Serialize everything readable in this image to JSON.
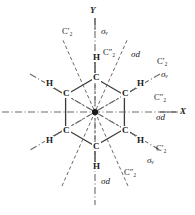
{
  "figure": {
    "type": "symmetry-element-diagram",
    "molecule": "benzene"
  },
  "axes": {
    "x_label": "X",
    "y_label": "Y"
  },
  "atoms": {
    "carbon_label": "C",
    "hydrogen_label": "H",
    "carbons": [
      {
        "id": "c-top",
        "label": "C"
      },
      {
        "id": "c-upper-left",
        "label": "C"
      },
      {
        "id": "c-upper-right",
        "label": "C"
      },
      {
        "id": "c-lower-left",
        "label": "C"
      },
      {
        "id": "c-lower-right",
        "label": "C"
      },
      {
        "id": "c-bottom",
        "label": "C"
      }
    ],
    "hydrogens": [
      {
        "id": "h-top",
        "label": "H"
      },
      {
        "id": "h-upper-left",
        "label": "H"
      },
      {
        "id": "h-upper-right",
        "label": "H"
      },
      {
        "id": "h-lower-left",
        "label": "H"
      },
      {
        "id": "h-lower-right",
        "label": "H"
      },
      {
        "id": "h-bottom",
        "label": "H"
      }
    ]
  },
  "symmetry_labels": {
    "c2_prime": {
      "base": "C",
      "sub": "2",
      "prime": "′"
    },
    "c2_double_prime": {
      "base": "C",
      "sub": "2",
      "prime": "″"
    },
    "sigma_v": {
      "base": "σ",
      "sub": "v"
    },
    "sigma_d": {
      "base": "σ",
      "sub": "d"
    },
    "items": [
      {
        "id": "c2p-top",
        "text": "C′₂",
        "kind": "C2-prime"
      },
      {
        "id": "sv-top",
        "text": "σᵥ",
        "kind": "sigma-v"
      },
      {
        "id": "c2pp-upper",
        "text": "C″₂",
        "kind": "C2-double-prime"
      },
      {
        "id": "sd-upper",
        "text": "σd",
        "kind": "sigma-d"
      },
      {
        "id": "c2p-right",
        "text": "C′₂",
        "kind": "C2-prime"
      },
      {
        "id": "sv-right",
        "text": "σᵥ",
        "kind": "sigma-v"
      },
      {
        "id": "c2pp-xaxis",
        "text": "C″₂",
        "kind": "C2-double-prime"
      },
      {
        "id": "sd-xaxis",
        "text": "σd",
        "kind": "sigma-d"
      },
      {
        "id": "c2p-lower",
        "text": "C′₂",
        "kind": "C2-prime"
      },
      {
        "id": "sv-lower",
        "text": "σᵥ",
        "kind": "sigma-v"
      },
      {
        "id": "c2pp-bottom",
        "text": "C″₂",
        "kind": "C2-double-prime"
      },
      {
        "id": "sd-bottom",
        "text": "σd",
        "kind": "sigma-d"
      }
    ]
  },
  "colors": {
    "ink": "#1a1a1a",
    "line": "#555555",
    "background": "#ffffff"
  }
}
